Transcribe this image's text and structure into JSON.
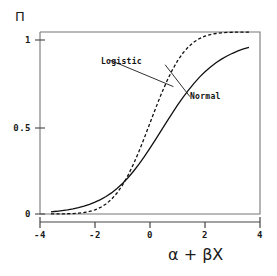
{
  "chart_data": {
    "type": "line",
    "title": "",
    "subtitle": "",
    "xlabel": "α + βX",
    "ylabel": "Π",
    "xlim": [
      -4,
      4
    ],
    "ylim": [
      0,
      1
    ],
    "grid": false,
    "legend_position": "inline-annotations",
    "xticks": [
      -4,
      -2,
      0,
      2,
      4
    ],
    "xtick_labels": [
      "-4",
      "-2",
      "0",
      "2",
      "4"
    ],
    "yticks": [
      0,
      0.5,
      1
    ],
    "ytick_labels": [
      "0",
      "0.5",
      "1"
    ],
    "annotations": [
      {
        "name": "logistic-annotation",
        "text": "Logistic",
        "x_data": -1.45,
        "y_data": 0.845,
        "leader_to_x_data": 0.85,
        "leader_to_y_data": 0.7
      },
      {
        "name": "normal-annotation",
        "text": "Normal",
        "x_data": 1.45,
        "y_data": 0.645,
        "leader_to_x_data": 0.55,
        "leader_to_y_data": 0.82
      }
    ],
    "series": [
      {
        "name": "Logistic",
        "style": "solid",
        "color": "#111111",
        "x": [
          -3.6,
          -3.4,
          -3.2,
          -3.0,
          -2.8,
          -2.6,
          -2.4,
          -2.2,
          -2.0,
          -1.8,
          -1.6,
          -1.4,
          -1.2,
          -1.0,
          -0.8,
          -0.6,
          -0.4,
          -0.2,
          0.0,
          0.2,
          0.4,
          0.6,
          0.8,
          1.0,
          1.2,
          1.4,
          1.6,
          1.8,
          2.0,
          2.2,
          2.4,
          2.6,
          2.8,
          3.0,
          3.2,
          3.4,
          3.6
        ],
        "y": [
          0.012,
          0.015,
          0.019,
          0.023,
          0.028,
          0.035,
          0.043,
          0.053,
          0.065,
          0.079,
          0.096,
          0.116,
          0.14,
          0.168,
          0.199,
          0.235,
          0.274,
          0.317,
          0.362,
          0.409,
          0.457,
          0.505,
          0.552,
          0.598,
          0.641,
          0.681,
          0.718,
          0.752,
          0.782,
          0.808,
          0.831,
          0.851,
          0.868,
          0.883,
          0.896,
          0.907,
          0.916
        ]
      },
      {
        "name": "Normal",
        "style": "dashed",
        "color": "#111111",
        "x": [
          -3.6,
          -3.4,
          -3.2,
          -3.0,
          -2.8,
          -2.6,
          -2.4,
          -2.2,
          -2.0,
          -1.8,
          -1.6,
          -1.4,
          -1.2,
          -1.0,
          -0.8,
          -0.6,
          -0.4,
          -0.2,
          0.0,
          0.2,
          0.4,
          0.6,
          0.8,
          1.0,
          1.2,
          1.4,
          1.6,
          1.8,
          2.0,
          2.2,
          2.4,
          2.6,
          2.8,
          3.0,
          3.2,
          3.4,
          3.6
        ],
        "y": [
          0.0002,
          0.0003,
          0.0007,
          0.0013,
          0.0026,
          0.0047,
          0.0082,
          0.0139,
          0.0228,
          0.0359,
          0.0548,
          0.0808,
          0.1151,
          0.1587,
          0.2119,
          0.2743,
          0.3446,
          0.4207,
          0.5,
          0.5793,
          0.6554,
          0.7257,
          0.7881,
          0.8413,
          0.8849,
          0.9192,
          0.9452,
          0.9641,
          0.9772,
          0.9861,
          0.9918,
          0.9953,
          0.9974,
          0.9987,
          0.9993,
          0.9997,
          0.9998
        ]
      }
    ]
  },
  "axes": {
    "y_title": "Π",
    "x_title": "α + βX"
  },
  "labels": {
    "logistic": "Logistic",
    "normal": "Normal",
    "ytick_1": "1",
    "ytick_05": "0.5",
    "ytick_0": "0",
    "xtick_m4": "-4",
    "xtick_m2": "-2",
    "xtick_0": "0",
    "xtick_2": "2",
    "xtick_4": "4"
  },
  "colors": {
    "frame": "#777777",
    "curve": "#111111",
    "text": "#1a1a1a",
    "background": "#ffffff"
  }
}
